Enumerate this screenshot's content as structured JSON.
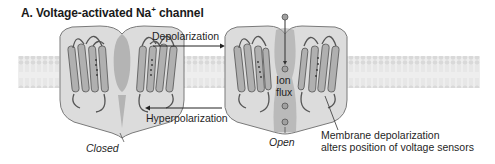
{
  "figure": {
    "title_main": "A. Voltage-activated Na",
    "title_sup": "+",
    "title_rest": " channel"
  },
  "labels": {
    "depolarization": "Depolarization",
    "hyperpolarization": "Hyperpolarization",
    "closed": "Closed",
    "open": "Open",
    "ion": "Ion",
    "flux": "flux",
    "sensor_line1": "Membrane depolarization",
    "sensor_line2": "alters position of voltage sensors"
  },
  "colors": {
    "channel_fill": "#d8d8d8",
    "channel_dark": "#8a8a8a",
    "membrane": "#e6e6e6",
    "helix": "#a8a8a8",
    "text": "#1f1f1f"
  }
}
